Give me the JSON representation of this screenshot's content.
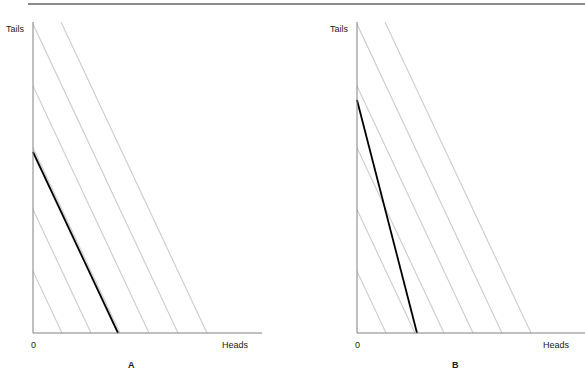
{
  "figure": {
    "width": 585,
    "height": 388,
    "background_color": "#ffffff",
    "top_rule_color": "#8a8a8a",
    "axis_color": "#808080",
    "budget_line_color": "#000000",
    "indifference_curve_color": "#cccccc"
  },
  "panels": [
    {
      "id": "A",
      "label": "A",
      "label_x": 128,
      "label_y": 360,
      "y_axis_label": "Tails",
      "y_axis_label_x": 6,
      "y_axis_label_y": 24,
      "x_axis_label": "Heads",
      "x_axis_label_x": 222,
      "x_axis_label_y": 340,
      "origin_label": "0",
      "origin_label_x": 31,
      "origin_label_y": 340,
      "plot": {
        "x0": 33,
        "y0": 333,
        "x_axis_end": 262,
        "y_axis_top": 22
      },
      "budget_line": {
        "name": "budget-line",
        "x_start": 33,
        "y_start": 152,
        "x_end": 118,
        "y_end": 333,
        "slope": -2.13,
        "stroke_width": 1.8
      },
      "indifference_curves": {
        "name": "indifference-curves",
        "slope": -2.13,
        "x_intercepts": [
          33,
          62,
          91,
          120,
          149,
          178,
          207
        ],
        "stroke_width": 1.1
      }
    },
    {
      "id": "B",
      "label": "B",
      "label_x": 452,
      "label_y": 360,
      "y_axis_label": "Tails",
      "y_axis_label_x": 330,
      "y_axis_label_y": 24,
      "x_axis_label": "Heads",
      "x_axis_label_x": 543,
      "x_axis_label_y": 340,
      "origin_label": "0",
      "origin_label_x": 355,
      "origin_label_y": 340,
      "plot": {
        "x0": 357,
        "y0": 333,
        "x_axis_end": 585,
        "y_axis_top": 22
      },
      "budget_line": {
        "name": "budget-line",
        "x_start": 357,
        "y_start": 100,
        "x_end": 417,
        "y_end": 333,
        "slope": -3.88,
        "stroke_width": 1.8
      },
      "indifference_curves": {
        "name": "indifference-curves",
        "slope": -2.13,
        "x_intercepts": [
          357,
          386,
          415,
          444,
          473,
          502,
          531
        ],
        "stroke_width": 1.1
      }
    }
  ],
  "chart_data": {
    "type": "line",
    "title": "",
    "subtitle": "",
    "xlabel": "Heads",
    "ylabel": "Tails",
    "panels": [
      {
        "name": "A",
        "description": "Budget line flatter than indifference curves",
        "series": [
          {
            "name": "budget-line",
            "color": "#000000",
            "points": [
              [
                0,
                181
              ],
              [
                85,
                0
              ]
            ],
            "slope": -2.13
          },
          {
            "name": "indifference-curves",
            "color": "#cccccc",
            "slope": -2.13,
            "count": 7,
            "x_intercepts": [
              0,
              29,
              58,
              87,
              116,
              145,
              174
            ]
          }
        ],
        "xlim": [
          0,
          229
        ],
        "ylim": [
          0,
          311
        ],
        "grid": false,
        "legend": "none"
      },
      {
        "name": "B",
        "description": "Budget line steeper than indifference curves",
        "series": [
          {
            "name": "budget-line",
            "color": "#000000",
            "points": [
              [
                0,
                233
              ],
              [
                60,
                0
              ]
            ],
            "slope": -3.88
          },
          {
            "name": "indifference-curves",
            "color": "#cccccc",
            "slope": -2.13,
            "count": 7,
            "x_intercepts": [
              0,
              29,
              58,
              87,
              116,
              145,
              174
            ]
          }
        ],
        "xlim": [
          0,
          228
        ],
        "ylim": [
          0,
          311
        ],
        "grid": false,
        "legend": "none"
      }
    ]
  }
}
